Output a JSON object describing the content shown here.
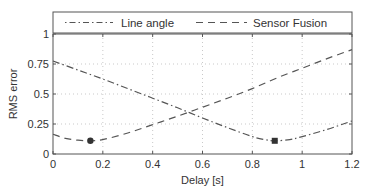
{
  "chart_data": {
    "type": "line",
    "title": "",
    "xlabel": "Delay [s]",
    "ylabel": "RMS error",
    "xlim": [
      0,
      1.2
    ],
    "ylim": [
      0,
      1
    ],
    "xticks": [
      0,
      0.2,
      0.4,
      0.6,
      0.8,
      1,
      1.2
    ],
    "xtick_labels": [
      "0",
      "0.2",
      "0.4",
      "0.6",
      "0.8",
      "1",
      "1.2"
    ],
    "yticks": [
      0,
      0.25,
      0.5,
      0.75,
      1
    ],
    "ytick_labels": [
      "0",
      "0.25",
      "0.5",
      "0.75",
      "1"
    ],
    "grid": true,
    "legend_position": "top-outside",
    "series": [
      {
        "name": "Line angle",
        "style": "dash-dot",
        "color": "#555555",
        "x": [
          0,
          0.1,
          0.2,
          0.3,
          0.4,
          0.5,
          0.6,
          0.7,
          0.8,
          0.85,
          0.89,
          0.95,
          1.0,
          1.1,
          1.2
        ],
        "y": [
          0.775,
          0.7,
          0.625,
          0.545,
          0.465,
          0.385,
          0.3,
          0.22,
          0.145,
          0.12,
          0.11,
          0.12,
          0.145,
          0.205,
          0.275
        ],
        "marker": {
          "x": 0.89,
          "y": 0.11,
          "shape": "square"
        }
      },
      {
        "name": "Sensor Fusion",
        "style": "dashed",
        "color": "#555555",
        "x": [
          0,
          0.05,
          0.1,
          0.15,
          0.2,
          0.3,
          0.4,
          0.5,
          0.6,
          0.7,
          0.8,
          0.9,
          1.0,
          1.1,
          1.2
        ],
        "y": [
          0.165,
          0.13,
          0.115,
          0.11,
          0.12,
          0.175,
          0.245,
          0.315,
          0.39,
          0.465,
          0.545,
          0.635,
          0.715,
          0.795,
          0.87
        ],
        "marker": {
          "x": 0.15,
          "y": 0.11,
          "shape": "circle"
        }
      }
    ]
  },
  "legend": {
    "items": [
      {
        "label": "Line angle"
      },
      {
        "label": "Sensor Fusion"
      }
    ]
  }
}
